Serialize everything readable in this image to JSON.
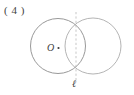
{
  "figure": {
    "item_number_label": "( 4 )",
    "center_point_label": "O",
    "line_label": "ℓ",
    "background_color": "#ffffff",
    "stroke_color": "#8d8d8d",
    "stroke_color_secondary": "#a6a6a6",
    "dashed_line_color": "#b9b9b9",
    "text_color": "#3d3d3d",
    "geometry": {
      "left_circle": {
        "cx": 58,
        "cy": 46,
        "r": 27.5
      },
      "right_circle": {
        "cx": 93,
        "cy": 46,
        "r": 28
      },
      "center_dot": {
        "cx": 58.5,
        "cy": 48,
        "r": 1.1
      },
      "dashed_line": {
        "x": 76,
        "y1": 12,
        "y2": 80
      }
    }
  }
}
